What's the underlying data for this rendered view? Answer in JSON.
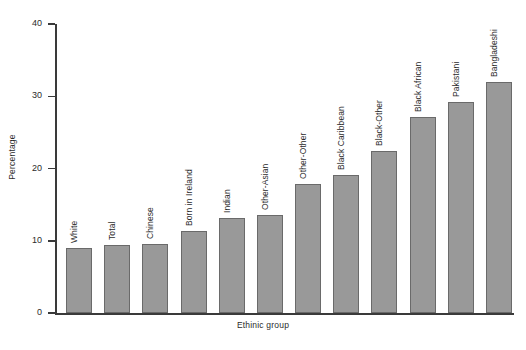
{
  "chart_data": {
    "type": "bar",
    "title": "",
    "xlabel": "Ethinic group",
    "ylabel": "Percentage",
    "ylim": [
      0,
      40
    ],
    "yticks": [
      0,
      10,
      20,
      30,
      40
    ],
    "grid": false,
    "legend": null,
    "bar_color": "#999999",
    "bar_edge_color": "#6a6a6a",
    "axis_color": "#3a3a3a",
    "categories": [
      "White",
      "Total",
      "Chinese",
      "Born in Ireland",
      "Indian",
      "Other-Asian",
      "Other-Other",
      "Black Caribbean",
      "Black-Other",
      "Black African",
      "Pakistani",
      "Bangladeshi"
    ],
    "values": [
      9.0,
      9.4,
      9.5,
      11.4,
      13.2,
      13.5,
      17.8,
      19.1,
      22.4,
      27.1,
      29.2,
      32.0
    ]
  }
}
